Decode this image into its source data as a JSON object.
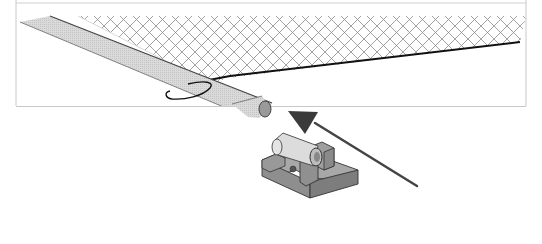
{
  "figure": {
    "colors": {
      "frame_border": "#c8c8c8",
      "rod_fill": "#d6d6d6",
      "rod_outline": "#555555",
      "netting": "#8a8a8a",
      "netting_edge": "#111111",
      "bracket_fill": "#8e8e8e",
      "bracket_top": "#a8a8a8",
      "insert_fill": "#dcdcdc",
      "arrow": "#444444"
    },
    "components": [
      {
        "name": "rod"
      },
      {
        "name": "chain-link-netting"
      },
      {
        "name": "cord-loop"
      },
      {
        "name": "mounting-bracket"
      },
      {
        "name": "bracket-insert"
      },
      {
        "name": "direction-arrow"
      }
    ]
  }
}
